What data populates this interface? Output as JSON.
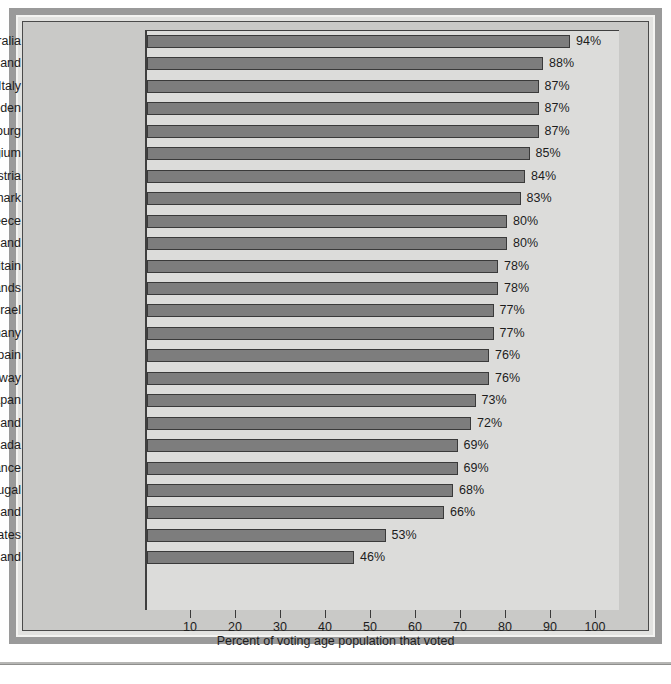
{
  "chart_data": {
    "type": "bar",
    "orientation": "horizontal",
    "title": "",
    "xlabel": "Percent of voting age population that voted",
    "ylabel": "",
    "xlim": [
      0,
      100
    ],
    "xticks": [
      10,
      20,
      30,
      40,
      50,
      60,
      70,
      80,
      90,
      100
    ],
    "xtick_labels": [
      "10",
      "20",
      "30",
      "40",
      "50",
      "60",
      "70",
      "80",
      "90",
      "100"
    ],
    "grid": false,
    "legend": false,
    "value_suffix": "%",
    "categories": [
      "Australia",
      "Iceland",
      "Italy",
      "Sweden",
      "Luxembourg",
      "Belgium",
      "Austria",
      "Denmark",
      "Greece",
      "New Zealand",
      "Great Britain",
      "Netherlands",
      "Israel",
      "West Germany",
      "Spain",
      "Norway",
      "Japan",
      "Finland",
      "Canada",
      "France",
      "Portugal",
      "Ireland",
      "United States",
      "Switzerland"
    ],
    "values": [
      94,
      88,
      87,
      87,
      87,
      85,
      84,
      83,
      80,
      80,
      78,
      78,
      77,
      77,
      76,
      76,
      73,
      72,
      69,
      69,
      68,
      66,
      53,
      46
    ],
    "value_labels": [
      "94%",
      "88%",
      "87%",
      "87%",
      "87%",
      "85%",
      "84%",
      "83%",
      "80%",
      "80%",
      "78%",
      "78%",
      "77%",
      "77%",
      "76%",
      "76%",
      "73%",
      "72%",
      "69%",
      "69%",
      "68%",
      "66%",
      "53%",
      "46%"
    ],
    "colors": {
      "bar_fill": "#7d7d7d",
      "bar_edge": "#3a3a3a",
      "plot_background": "#dcdcda",
      "figure_background": "#c9c9c7",
      "frame_band": "#9a9a9a",
      "text": "#1d1d1d"
    }
  }
}
